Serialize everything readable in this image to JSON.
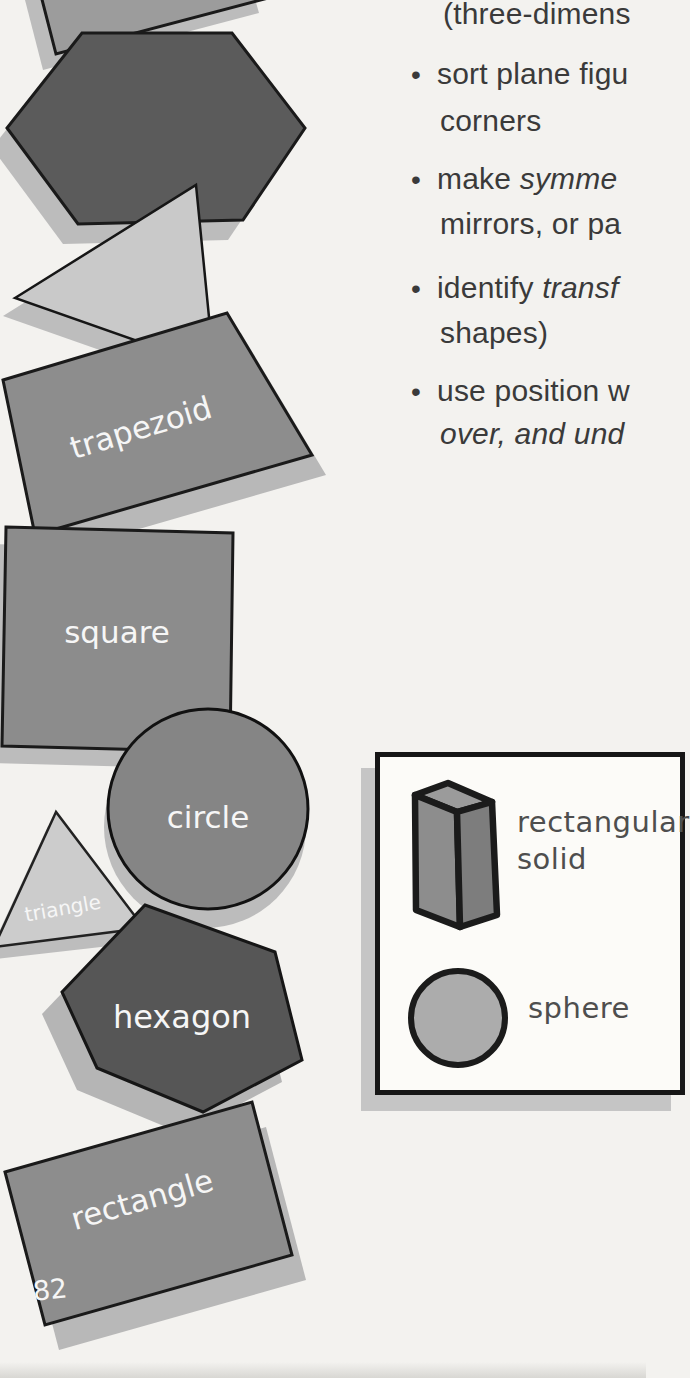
{
  "page": {
    "number": "82",
    "background_color": "#f3f2ef"
  },
  "objectives": {
    "bullet_char": "•",
    "lines": [
      {
        "pre": "(three-dimens",
        "em": ""
      },
      {
        "pre": "sort plane figu",
        "em": ""
      },
      {
        "pre": "corners",
        "em": ""
      },
      {
        "pre": "make ",
        "em": "symme"
      },
      {
        "pre": "mirrors, or pa",
        "em": ""
      },
      {
        "pre": "identify ",
        "em": "transf"
      },
      {
        "pre": "shapes)",
        "em": ""
      },
      {
        "pre": "use position w",
        "em": ""
      },
      {
        "pre": "",
        "em": "over, and und"
      }
    ]
  },
  "shape_labels": {
    "trapezoid": "trapezoid",
    "square": "square",
    "circle": "circle",
    "triangle": "triangle",
    "hexagon": "hexagon",
    "rectangle": "rectangle"
  },
  "legend": {
    "rectangular_solid_line1": "rectangular",
    "rectangular_solid_line2": "solid",
    "sphere": "sphere"
  },
  "colors": {
    "dark_shape": "#565656",
    "medium_shape": "#8d8d8d",
    "light_shape": "#c9c9c9",
    "shadow": "#b8b8b8",
    "outline": "#1a1a1a",
    "label_text": "#f6f6f6",
    "body_text": "#3a3a3a",
    "legend_text": "#4e4e4e"
  }
}
